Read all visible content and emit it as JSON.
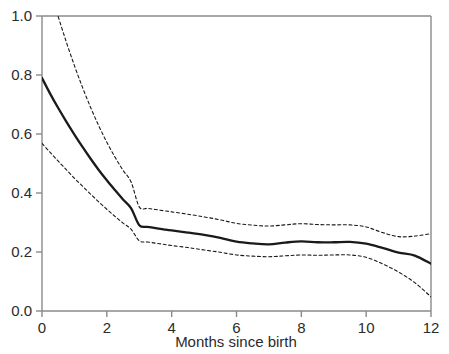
{
  "figure": {
    "background_color": "#ffffff",
    "line_color": "#1a1a1a",
    "axis_color": "#8a8a8a",
    "tick_label_color": "#2b2b2b"
  },
  "axes": {
    "x_title": "Months since birth",
    "y_title": "",
    "x_ticks": [
      "0",
      "2",
      "4",
      "6",
      "8",
      "10",
      "12"
    ],
    "y_ticks": [
      "0.0",
      "0.2",
      "0.4",
      "0.6",
      "0.8",
      "1.0"
    ]
  },
  "chart_data": {
    "type": "line",
    "title": "",
    "xlabel": "Months since birth",
    "ylabel": "",
    "xlim": [
      0,
      12
    ],
    "ylim": [
      0,
      1
    ],
    "grid": false,
    "legend": "none",
    "x_tick_values": [
      0,
      2,
      4,
      6,
      8,
      10,
      12
    ],
    "y_tick_values": [
      0.0,
      0.2,
      0.4,
      0.6,
      0.8,
      1.0
    ],
    "x": [
      0.0,
      0.25,
      0.5,
      0.75,
      1.0,
      1.25,
      1.5,
      1.75,
      2.0,
      2.25,
      2.5,
      2.75,
      3.0,
      3.25,
      3.5,
      3.75,
      4.0,
      4.5,
      5.0,
      5.5,
      6.0,
      6.5,
      7.0,
      7.5,
      8.0,
      8.5,
      9.0,
      9.5,
      10.0,
      10.5,
      11.0,
      11.5,
      12.0
    ],
    "series": [
      {
        "name": "estimate",
        "style": "solid",
        "values": [
          0.79,
          0.737,
          0.688,
          0.642,
          0.598,
          0.556,
          0.516,
          0.478,
          0.443,
          0.41,
          0.378,
          0.348,
          0.291,
          0.285,
          0.281,
          0.277,
          0.273,
          0.266,
          0.258,
          0.248,
          0.235,
          0.229,
          0.226,
          0.232,
          0.236,
          0.233,
          0.233,
          0.234,
          0.228,
          0.214,
          0.198,
          0.188,
          0.16
        ]
      },
      {
        "name": "upper-confidence-limit",
        "style": "dashed",
        "values": [
          1.18,
          1.088,
          0.998,
          0.912,
          0.832,
          0.758,
          0.69,
          0.628,
          0.572,
          0.522,
          0.477,
          0.437,
          0.353,
          0.348,
          0.344,
          0.34,
          0.336,
          0.328,
          0.319,
          0.309,
          0.297,
          0.291,
          0.288,
          0.292,
          0.296,
          0.293,
          0.292,
          0.292,
          0.285,
          0.266,
          0.252,
          0.254,
          0.262
        ]
      },
      {
        "name": "lower-confidence-limit",
        "style": "dashed",
        "values": [
          0.568,
          0.538,
          0.508,
          0.479,
          0.45,
          0.423,
          0.396,
          0.37,
          0.345,
          0.321,
          0.298,
          0.277,
          0.238,
          0.234,
          0.23,
          0.226,
          0.222,
          0.215,
          0.207,
          0.199,
          0.19,
          0.186,
          0.184,
          0.187,
          0.19,
          0.189,
          0.19,
          0.19,
          0.182,
          0.16,
          0.132,
          0.096,
          0.048
        ]
      }
    ]
  }
}
